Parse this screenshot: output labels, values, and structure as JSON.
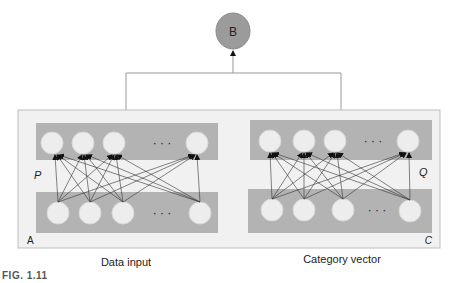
{
  "diagram": {
    "output_node": {
      "label": "B",
      "fill": "#9b9b9b"
    },
    "container": {
      "corner_labels": {
        "left": "A",
        "right": "C"
      },
      "fill": "#f1f1f1",
      "stroke": "#bdbdbd"
    },
    "left_network": {
      "hidden_label": "P",
      "caption": "Data input",
      "ellipsis": "· · ·"
    },
    "right_network": {
      "hidden_label": "Q",
      "caption": "Category vector",
      "ellipsis": "· · ·"
    },
    "layer_fill": "#b3b3b3",
    "node_fill": "#ededed"
  },
  "figure_label": "FIG. 1.11"
}
